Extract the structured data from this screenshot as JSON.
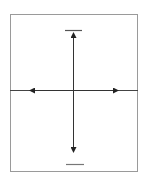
{
  "diagram": {
    "type": "axis-cross",
    "frame": {
      "x1": 10,
      "y1": 14,
      "x2": 138,
      "y2": 172,
      "color": "#9a9a9a"
    },
    "center": {
      "x": 73,
      "y": 90
    },
    "line_color": "#333333",
    "top_label_bar": {
      "x1": 65,
      "x2": 82,
      "y": 30,
      "color": "#555555"
    },
    "bottom_label_bar": {
      "x1": 66,
      "x2": 84,
      "y": 164,
      "color": "#777777"
    },
    "vertical_axis": {
      "x": 73,
      "y_top": 33,
      "y_bottom": 152,
      "arrow_up": true,
      "arrow_down": true
    },
    "horizontal_axis": {
      "y": 90,
      "x_left_end": 10,
      "x_right_end": 138,
      "arrow_left_x": 30,
      "arrow_right_x": 118
    }
  }
}
